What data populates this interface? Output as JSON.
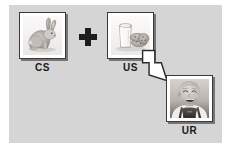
{
  "figure": {
    "background_color": "#ffffff",
    "panel_color": "#d5d5d5"
  },
  "boxes": [
    {
      "id": "cs",
      "label": "CS",
      "image_name": "rabbit-photo",
      "image_description": "Gray and white rabbit sitting"
    },
    {
      "id": "us",
      "label": "US",
      "image_name": "milk-and-cookies-photo",
      "image_description": "Glass of milk with cookies"
    },
    {
      "id": "ur",
      "label": "UR",
      "image_name": "smiling-child-photo",
      "image_description": "Smiling young child in overalls"
    }
  ],
  "connectors": {
    "plus": {
      "name": "plus-sign",
      "symbol": "+",
      "color": "#1d1d1d"
    },
    "arrow": {
      "name": "arrow-down-right-icon",
      "direction": "down-right",
      "fill": "#ffffff",
      "stroke": "#2b2b2b"
    }
  }
}
